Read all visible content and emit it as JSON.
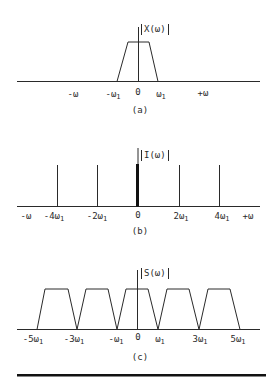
{
  "panels": [
    {
      "id": "a",
      "caption": "(a)",
      "y_label": "X(ω)",
      "ticks": [
        {
          "label": "-ω",
          "sub": ""
        },
        {
          "label": "-ω",
          "sub": "1"
        },
        {
          "label": "0",
          "sub": ""
        },
        {
          "label": "ω",
          "sub": "1"
        },
        {
          "label": "+ω",
          "sub": ""
        }
      ]
    },
    {
      "id": "b",
      "caption": "(b)",
      "y_label": "I(ω)",
      "ticks": [
        {
          "label": "-ω",
          "sub": ""
        },
        {
          "label": "-4ω",
          "sub": "1"
        },
        {
          "label": "-2ω",
          "sub": "1"
        },
        {
          "label": "0",
          "sub": ""
        },
        {
          "label": "2ω",
          "sub": "1"
        },
        {
          "label": "4ω",
          "sub": "1"
        },
        {
          "label": "+ω",
          "sub": ""
        }
      ]
    },
    {
      "id": "c",
      "caption": "(c)",
      "y_label": "S(ω)",
      "ticks": [
        {
          "label": "-5ω",
          "sub": "1"
        },
        {
          "label": "-3ω",
          "sub": "1"
        },
        {
          "label": "-ω",
          "sub": "1"
        },
        {
          "label": "0",
          "sub": ""
        },
        {
          "label": "ω",
          "sub": "1"
        },
        {
          "label": "3ω",
          "sub": "1"
        },
        {
          "label": "5ω",
          "sub": "1"
        }
      ]
    }
  ],
  "diagram": {
    "a": {
      "type": "trapezoid spectrum",
      "support": [
        "-ω1",
        "ω1"
      ],
      "center": 0
    },
    "b": {
      "type": "impulse train",
      "impulses_at": [
        "-4ω1",
        "-2ω1",
        "0",
        "2ω1",
        "4ω1"
      ],
      "dc_emphasized": true
    },
    "c": {
      "type": "periodic replicated trapezoids",
      "centers": [
        "-4ω1",
        "-2ω1",
        "0",
        "2ω1",
        "4ω1"
      ],
      "edges_at": [
        "-5ω1",
        "-3ω1",
        "-ω1",
        "ω1",
        "3ω1",
        "5ω1"
      ]
    }
  }
}
